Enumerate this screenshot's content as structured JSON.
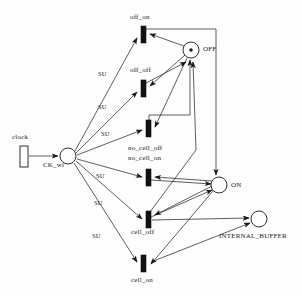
{
  "diagram": {
    "type": "petri-net",
    "title": "",
    "places": [
      {
        "id": "OFF",
        "label": "OFF",
        "cx": 191,
        "cy": 50,
        "r": 8,
        "tokens": 1
      },
      {
        "id": "ON",
        "label": "ON",
        "cx": 219,
        "cy": 185,
        "r": 8,
        "tokens": 0
      },
      {
        "id": "INTERNAL_BUFFER",
        "label": "INTERNAL_BUFFER",
        "cx": 259,
        "cy": 219,
        "r": 8,
        "tokens": 0
      },
      {
        "id": "CK_wi",
        "label": "CK_wi",
        "cx": 68,
        "cy": 156,
        "r": 8,
        "tokens": 0
      }
    ],
    "transitions": [
      {
        "id": "clock",
        "label": "clock",
        "x": 20,
        "y": 146,
        "w": 8,
        "h": 21,
        "filled": false
      },
      {
        "id": "off_on",
        "label": "off_on",
        "x": 141,
        "y": 26,
        "w": 5,
        "h": 17,
        "filled": true
      },
      {
        "id": "off_off",
        "label": "off_off",
        "x": 141,
        "y": 80,
        "w": 5,
        "h": 17,
        "filled": true
      },
      {
        "id": "no_cell_off",
        "label": "no_cell_off",
        "x": 146,
        "y": 120,
        "w": 5,
        "h": 17,
        "filled": true
      },
      {
        "id": "no_cell_on",
        "label": "no_cell_on",
        "x": 146,
        "y": 169,
        "w": 5,
        "h": 17,
        "filled": true
      },
      {
        "id": "cell_off",
        "label": "cell_off",
        "x": 146,
        "y": 211,
        "w": 5,
        "h": 17,
        "filled": true
      },
      {
        "id": "cell_on",
        "label": "cell_on",
        "x": 141,
        "y": 255,
        "w": 5,
        "h": 17,
        "filled": true
      }
    ],
    "arc_labels": [
      {
        "text": "SU",
        "x": 98,
        "y": 71
      },
      {
        "text": "SU",
        "x": 98,
        "y": 104
      },
      {
        "text": "SU",
        "x": 101,
        "y": 131
      },
      {
        "text": "SU",
        "x": 96,
        "y": 173
      },
      {
        "text": "SU",
        "x": 94,
        "y": 200
      },
      {
        "text": "SU",
        "x": 92,
        "y": 233
      }
    ],
    "node_labels": [
      {
        "text": "off_on",
        "x": 130,
        "y": 14,
        "cls": "big"
      },
      {
        "text": "off_off",
        "x": 130,
        "y": 67,
        "cls": "big"
      },
      {
        "text": "no_cell_off",
        "x": 128,
        "y": 145,
        "cls": "big"
      },
      {
        "text": "no_cell_on",
        "x": 128,
        "y": 155,
        "cls": "big"
      },
      {
        "text": "cell_off",
        "x": 131,
        "y": 229,
        "cls": "big"
      },
      {
        "text": "cell_on",
        "x": 131,
        "y": 277,
        "cls": "big"
      },
      {
        "text": "clock",
        "x": 12,
        "y": 134,
        "cls": "big"
      },
      {
        "text": "CK_wi",
        "x": 43,
        "y": 162,
        "cls": "big"
      },
      {
        "text": "OFF",
        "x": 203,
        "y": 46,
        "cls": "big"
      },
      {
        "text": "ON",
        "x": 231,
        "y": 182,
        "cls": "big"
      },
      {
        "text": "INTERNAL_BUFFER",
        "x": 219,
        "y": 233,
        "cls": "big"
      }
    ],
    "colors": {
      "stroke": "#1a1a1a",
      "fill": "#ffffff",
      "transition_fill": "#111111",
      "background": "#ffffff"
    }
  }
}
